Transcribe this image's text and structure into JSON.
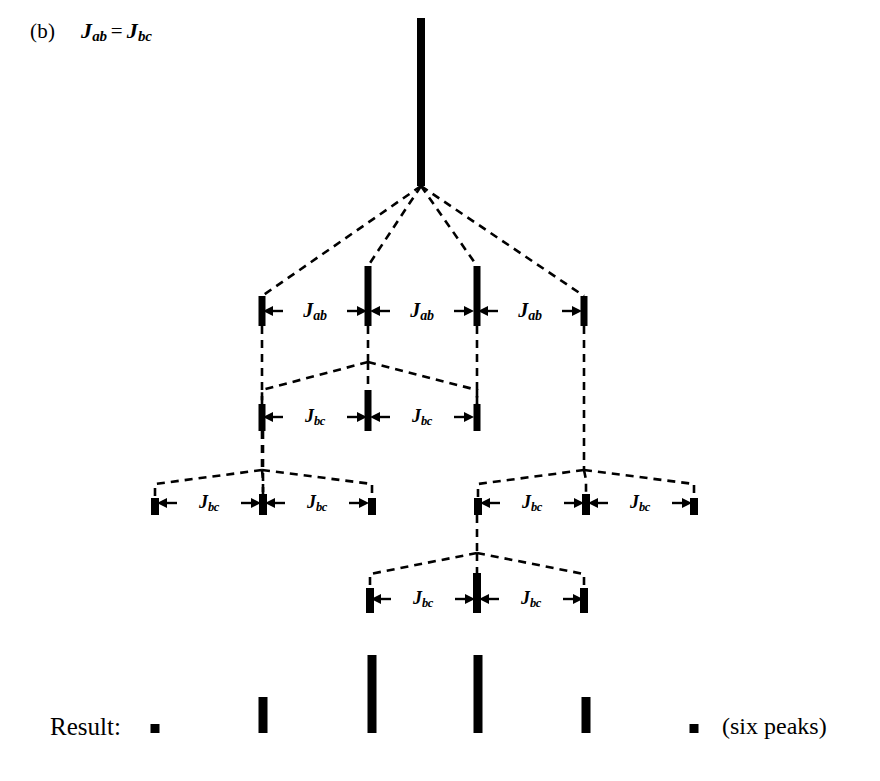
{
  "figure": {
    "panel_label": "(b)",
    "condition": {
      "left_symbol": "J",
      "left_sub": "ab",
      "relation": "=",
      "right_symbol": "J",
      "right_sub": "bc"
    },
    "background_color": "#ffffff",
    "ink_color": "#000000"
  },
  "result_row": {
    "label": "Result:",
    "note": "(six peaks)"
  },
  "couplings": {
    "jab": {
      "symbol": "J",
      "sub": "ab"
    },
    "jbc": {
      "symbol": "J",
      "sub": "bc"
    }
  },
  "chart_data": {
    "type": "diagram-tree",
    "levels": [
      {
        "index": 0,
        "name": "root",
        "coupling": null,
        "peaks": [
          {
            "x": 421,
            "top": 18,
            "bottom": 186,
            "width": 8,
            "intensity": 1
          }
        ]
      },
      {
        "index": 1,
        "name": "quartet-J-ab",
        "coupling": "J_ab",
        "n_gaps": 3,
        "peaks": [
          {
            "x": 262,
            "top": 296,
            "bottom": 326,
            "width": 7,
            "intensity": 1
          },
          {
            "x": 368,
            "top": 266,
            "bottom": 326,
            "width": 7,
            "intensity": 3
          },
          {
            "x": 477,
            "top": 266,
            "bottom": 326,
            "width": 7,
            "intensity": 3
          },
          {
            "x": 584,
            "top": 296,
            "bottom": 326,
            "width": 7,
            "intensity": 1
          }
        ]
      },
      {
        "index": 2,
        "name": "triplet-J-bc-from-peak2",
        "coupling": "J_bc",
        "parent_x": 368,
        "n_gaps": 2,
        "peaks": [
          {
            "x": 262,
            "top": 404,
            "bottom": 431,
            "width": 7,
            "intensity": 1
          },
          {
            "x": 368,
            "top": 390,
            "bottom": 431,
            "width": 7,
            "intensity": 2
          },
          {
            "x": 477,
            "top": 404,
            "bottom": 431,
            "width": 7,
            "intensity": 1
          }
        ]
      },
      {
        "index": 3,
        "name": "triplet-J-bc-left",
        "coupling": "J_bc",
        "parent_x": 262,
        "n_gaps": 2,
        "peaks": [
          {
            "x": 155,
            "top": 498,
            "bottom": 515,
            "width": 8,
            "intensity": 1
          },
          {
            "x": 263,
            "top": 494,
            "bottom": 515,
            "width": 8,
            "intensity": 1
          },
          {
            "x": 372,
            "top": 498,
            "bottom": 515,
            "width": 8,
            "intensity": 1
          }
        ]
      },
      {
        "index": 4,
        "name": "triplet-J-bc-right",
        "coupling": "J_bc",
        "parent_x": 584,
        "n_gaps": 2,
        "peaks": [
          {
            "x": 478,
            "top": 498,
            "bottom": 515,
            "width": 8,
            "intensity": 1
          },
          {
            "x": 586,
            "top": 494,
            "bottom": 515,
            "width": 8,
            "intensity": 1
          },
          {
            "x": 694,
            "top": 498,
            "bottom": 515,
            "width": 8,
            "intensity": 1
          }
        ]
      },
      {
        "index": 5,
        "name": "triplet-J-bc-from-peak3",
        "coupling": "J_bc",
        "parent_x": 477,
        "n_gaps": 2,
        "peaks": [
          {
            "x": 370,
            "top": 588,
            "bottom": 613,
            "width": 8,
            "intensity": 1
          },
          {
            "x": 477,
            "top": 573,
            "bottom": 613,
            "width": 8,
            "intensity": 2
          },
          {
            "x": 584,
            "top": 588,
            "bottom": 613,
            "width": 8,
            "intensity": 1
          }
        ]
      }
    ],
    "result_peaks": {
      "baseline": 733,
      "x": [
        155,
        263,
        372,
        478,
        586,
        694
      ],
      "heights": [
        9,
        36,
        78,
        78,
        36,
        9
      ],
      "relative_intensities": [
        1,
        5,
        10,
        10,
        5,
        1
      ],
      "count": 6
    },
    "j_labels": [
      {
        "text": "J_ab",
        "x": 315,
        "y": 311
      },
      {
        "text": "J_ab",
        "x": 422,
        "y": 311
      },
      {
        "text": "J_ab",
        "x": 530,
        "y": 311
      },
      {
        "text": "J_bc",
        "x": 315,
        "y": 417
      },
      {
        "text": "J_bc",
        "x": 422,
        "y": 417
      },
      {
        "text": "J_bc",
        "x": 209,
        "y": 503
      },
      {
        "text": "J_bc",
        "x": 317,
        "y": 503
      },
      {
        "text": "J_bc",
        "x": 532,
        "y": 503
      },
      {
        "text": "J_bc",
        "x": 640,
        "y": 503
      },
      {
        "text": "J_bc",
        "x": 423,
        "y": 599
      },
      {
        "text": "J_bc",
        "x": 531,
        "y": 599
      }
    ]
  }
}
